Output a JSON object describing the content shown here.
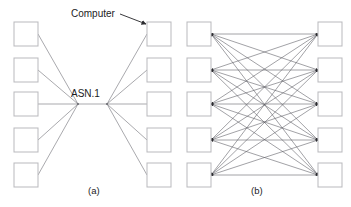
{
  "figure": {
    "background_color": "#ffffff",
    "node_stroke_color": "#b9b9bd",
    "link_color": "#6f6f75",
    "mesh_link_color": "#55555c",
    "text_color": "#1c1c1e",
    "width": 351,
    "height": 207
  },
  "annotations": {
    "computer_label": "Computer",
    "asn1_label": "ASN.1"
  },
  "captions": {
    "panel_a": "(a)",
    "panel_b": "(b)"
  },
  "panel_a": {
    "caption": "(a)",
    "topology": "star / hub-and-spoke via ASN.1",
    "left_column_count": 5,
    "right_column_count": 5,
    "hub_count": 2,
    "left_nodes": [
      {
        "label": "",
        "x": 14,
        "y": 22
      },
      {
        "label": "",
        "x": 14,
        "y": 58
      },
      {
        "label": "",
        "x": 14,
        "y": 92
      },
      {
        "label": "",
        "x": 14,
        "y": 128
      },
      {
        "label": "",
        "x": 14,
        "y": 163
      }
    ],
    "right_nodes": [
      {
        "label": "",
        "x": 147,
        "y": 22
      },
      {
        "label": "",
        "x": 147,
        "y": 58
      },
      {
        "label": "",
        "x": 147,
        "y": 92
      },
      {
        "label": "",
        "x": 147,
        "y": 128
      },
      {
        "label": "",
        "x": 147,
        "y": 163
      }
    ],
    "hubs": [
      {
        "name": "left-hub",
        "x": 78,
        "y": 104
      },
      {
        "name": "right-hub",
        "x": 107,
        "y": 104
      }
    ],
    "node_size": 24
  },
  "panel_b": {
    "caption": "(b)",
    "topology": "full bipartite mesh, bidirectional",
    "left_column_count": 5,
    "right_column_count": 5,
    "link_count": 25,
    "left_nodes": [
      {
        "label": "",
        "x": 187,
        "y": 22
      },
      {
        "label": "",
        "x": 187,
        "y": 58
      },
      {
        "label": "",
        "x": 187,
        "y": 92
      },
      {
        "label": "",
        "x": 187,
        "y": 128
      },
      {
        "label": "",
        "x": 187,
        "y": 163
      }
    ],
    "right_nodes": [
      {
        "label": "",
        "x": 318,
        "y": 22
      },
      {
        "label": "",
        "x": 318,
        "y": 58
      },
      {
        "label": "",
        "x": 318,
        "y": 92
      },
      {
        "label": "",
        "x": 318,
        "y": 128
      },
      {
        "label": "",
        "x": 318,
        "y": 163
      }
    ],
    "node_size": 24
  }
}
